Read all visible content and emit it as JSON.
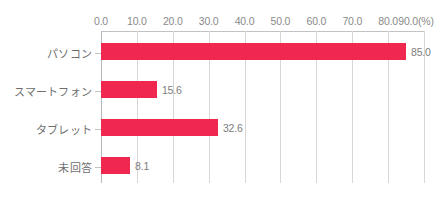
{
  "chart_data": {
    "type": "bar",
    "orientation": "horizontal",
    "title": "",
    "xlabel": "",
    "ylabel": "",
    "unit_label": "(%)",
    "categories": [
      "パソコン",
      "スマートフォン",
      "タブレット",
      "未回答"
    ],
    "values": [
      85.0,
      32.6,
      15.6,
      8.1
    ],
    "value_labels": [
      "85.0",
      "15.6",
      "32.6",
      "8.1"
    ],
    "series": [
      {
        "name": "",
        "values": [
          85.0,
          15.6,
          32.6,
          8.1
        ]
      }
    ],
    "bars": [
      {
        "category": "パソコン",
        "value": 85.0,
        "label": "85.0"
      },
      {
        "category": "スマートフォン",
        "value": 15.6,
        "label": "15.6"
      },
      {
        "category": "タブレット",
        "value": 32.6,
        "label": "32.6"
      },
      {
        "category": "未回答",
        "value": 8.1,
        "label": "8.1"
      }
    ],
    "xlim": [
      0,
      90
    ],
    "xticks": [
      0,
      10,
      20,
      30,
      40,
      50,
      60,
      70,
      80,
      90
    ],
    "xtick_labels": [
      "0.0",
      "10.0",
      "20.0",
      "30.0",
      "40.0",
      "50.0",
      "60.0",
      "70.0",
      "80.0",
      "90.0"
    ],
    "grid": true,
    "grid_axis": "x",
    "legend": false,
    "axis_position": "top",
    "colors": {
      "bar": "#f0274f",
      "gridline": "#d6d6d6",
      "axis": "#c2c2c2",
      "tick_text": "#8a8a8a",
      "value_text": "#7d7d7d",
      "category_text": "#6e6e6e",
      "background": "#ffffff"
    }
  },
  "caption": {
    "text": ""
  }
}
